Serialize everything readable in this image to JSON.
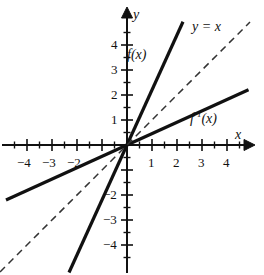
{
  "figure": {
    "width": 264,
    "height": 275,
    "background": "#ffffff",
    "ink_color": "#111111"
  },
  "axes": {
    "x_label": "x",
    "y_label": "y",
    "origin_px": [
      127,
      145
    ],
    "unit_px": 25,
    "x_tick_labels": [
      "-4",
      "-3",
      "-2",
      "1",
      "2",
      "3",
      "4"
    ],
    "y_tick_labels": [
      "4",
      "3",
      "2",
      "1",
      "-2",
      "-3",
      "-4"
    ],
    "x_ticks_major": [
      -4,
      -3,
      -2,
      -1,
      1,
      2,
      3,
      4
    ],
    "x_ticks_minor": [
      -4.5,
      -3.5,
      -2.5,
      -1.5,
      -0.5,
      0.5,
      1.5,
      2.5,
      3.5,
      4.5
    ],
    "y_ticks_major": [
      4,
      3,
      2,
      1,
      -1,
      -2,
      -3,
      -4
    ],
    "y_ticks_minor": [
      4.5,
      3.5,
      2.5,
      1.5,
      0.5,
      -0.5,
      -1.5,
      -2.5,
      -3.5,
      -4.5
    ],
    "zero_label_shown": false,
    "grid": false,
    "arrows": [
      "x-positive",
      "y-positive"
    ]
  },
  "labels": {
    "f": "f(x)",
    "f_inverse_base": "f",
    "f_inverse_exponent": "-1",
    "f_inverse_arg": "(x)",
    "identity": "y = x"
  },
  "chart_data": {
    "type": "line",
    "title": "",
    "xlabel": "x",
    "ylabel": "y",
    "xlim": [
      -5.1,
      5.0
    ],
    "ylim": [
      -5.2,
      5.0
    ],
    "grid": false,
    "legend": "inline-labels",
    "series": [
      {
        "name": "f(x)",
        "label": "f(x)",
        "style": "solid",
        "slope": 2.2,
        "intercept": 0,
        "x": [
          -2.32,
          2.24
        ],
        "y": [
          -5.1,
          4.93
        ],
        "label_position_data": [
          0.52,
          3.6
        ]
      },
      {
        "name": "f^-1(x)",
        "label": "f-1(x)",
        "style": "solid",
        "slope": 0.455,
        "intercept": 0,
        "x": [
          -4.84,
          4.86
        ],
        "y": [
          -2.2,
          2.21
        ],
        "label_position_data": [
          3.12,
          1.0
        ]
      },
      {
        "name": "y = x",
        "label": "y = x",
        "style": "dashed",
        "slope": 1,
        "intercept": 0,
        "x": [
          -5.08,
          4.92
        ],
        "y": [
          -5.08,
          4.92
        ],
        "label_position_data": [
          3.3,
          4.72
        ]
      }
    ]
  }
}
